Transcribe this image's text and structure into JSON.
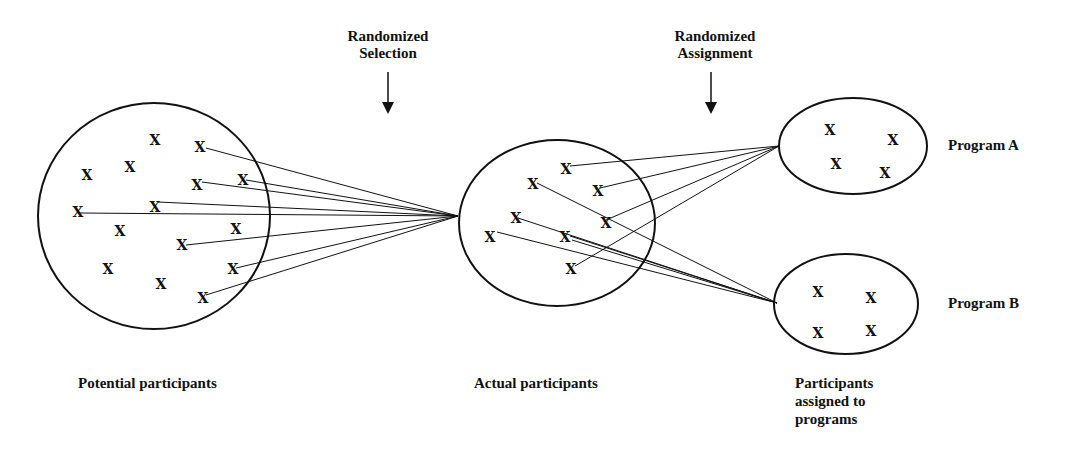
{
  "headers": {
    "selection": {
      "line1": "Randomized",
      "line2": "Selection"
    },
    "assignment": {
      "line1": "Randomized",
      "line2": "Assignment"
    }
  },
  "programs": {
    "a": "Program A",
    "b": "Program B"
  },
  "captions": {
    "potential": "Potential participants",
    "actual": "Actual participants",
    "assigned_line1": "Participants",
    "assigned_line2": "assigned to",
    "assigned_line3": "programs"
  },
  "marker": "X",
  "colors": {
    "ink": "#111111",
    "background": "#ffffff"
  }
}
